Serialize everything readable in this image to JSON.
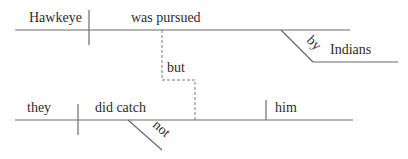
{
  "diagram": {
    "type": "sentence-diagram",
    "clause_1": {
      "subject": "Hawkeye",
      "verb": "was pursued",
      "modifier_preposition": "by",
      "preposition_object": "Indians"
    },
    "conjunction": "but",
    "clause_2": {
      "subject": "they",
      "verb": "did catch",
      "object": "him",
      "modifier": "not"
    }
  }
}
